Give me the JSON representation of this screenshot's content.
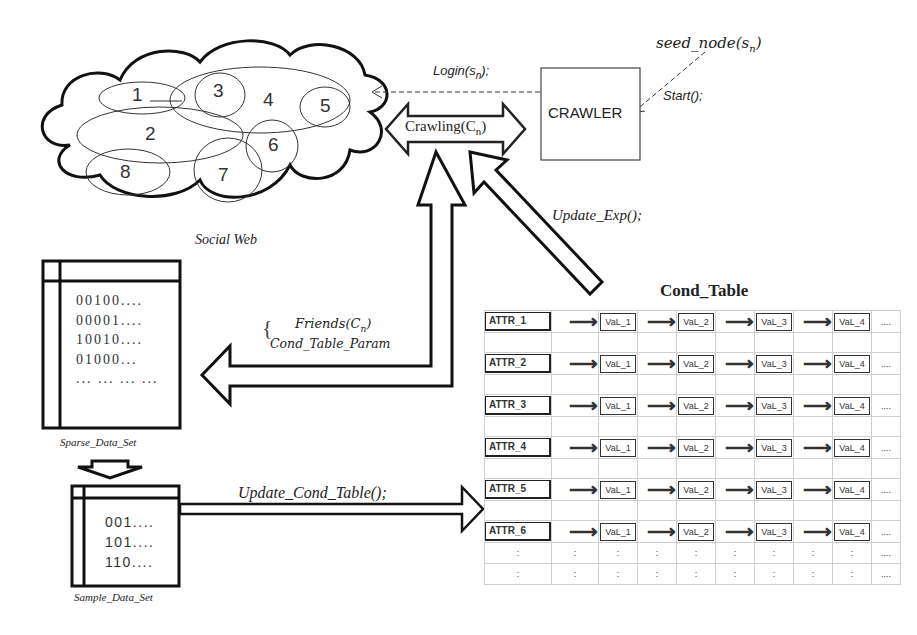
{
  "social_web": {
    "label": "Social Web",
    "nodes": [
      "1",
      "2",
      "3",
      "4",
      "5",
      "6",
      "7",
      "8"
    ]
  },
  "crawler": {
    "box_label": "CRAWLER",
    "seed_label": "seed_node(s",
    "seed_sub": "n",
    "start_label": "Start();",
    "login_label": "Login(s",
    "login_sub": "n",
    "login_tail": ");",
    "crawling_label": "Crawling(C",
    "crawling_sub": "n",
    "update_exp_label": "Update_Exp();"
  },
  "friends_block": {
    "line1": "Friends(C",
    "line1_sub": "n",
    "line2": "Cond_Table_Param"
  },
  "sparse_data_set": {
    "label": "Sparse_Data_Set",
    "rows": [
      "00100....",
      "00001....",
      "10010....",
      "01000...",
      "... ... ... ..."
    ]
  },
  "sample_data_set": {
    "label": "Sample_Data_Set",
    "rows": [
      "001....",
      "101....",
      "110...."
    ]
  },
  "update_cond_table_label": "Update_Cond_Table();",
  "cond_table": {
    "title": "Cond_Table",
    "rows": [
      {
        "attr": "ATTR_1",
        "vals": [
          "VaL_1",
          "VaL_2",
          "VaL_3",
          "VaL_4"
        ],
        "more": "...."
      },
      {
        "attr": "ATTR_2",
        "vals": [
          "VaL_1",
          "VaL_2",
          "VaL_3",
          "VaL_4"
        ],
        "more": "...."
      },
      {
        "attr": "ATTR_3",
        "vals": [
          "VaL_1",
          "VaL_2",
          "VaL_3",
          "VaL_4"
        ],
        "more": "...."
      },
      {
        "attr": "ATTR_4",
        "vals": [
          "VaL_1",
          "VaL_2",
          "VaL_3",
          "VaL_4"
        ],
        "more": "...."
      },
      {
        "attr": "ATTR_5",
        "vals": [
          "VaL_1",
          "VaL_2",
          "VaL_3",
          "VaL_4"
        ],
        "more": "...."
      },
      {
        "attr": "ATTR_6",
        "vals": [
          "VaL_1",
          "VaL_2",
          "VaL_3",
          "VaL_4"
        ],
        "more": "...."
      }
    ],
    "ellipsis_cell": ":",
    "ellipsis_more": "....",
    "arrow_glyph": "⟶"
  }
}
